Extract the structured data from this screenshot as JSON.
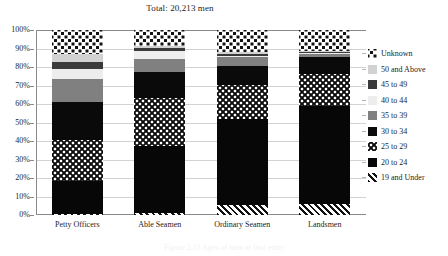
{
  "chart_data": {
    "type": "bar",
    "subtype": "stacked-percentage",
    "title": "Total: 20,213 men",
    "xlabel": "",
    "ylabel": "",
    "ylim": [
      0,
      100
    ],
    "ytick_labels": [
      "0%",
      "10%",
      "20%",
      "30%",
      "40%",
      "50%",
      "60%",
      "70%",
      "80%",
      "90%",
      "100%"
    ],
    "ytick_values": [
      0,
      10,
      20,
      30,
      40,
      50,
      60,
      70,
      80,
      90,
      100
    ],
    "grid": true,
    "legend_position": "right",
    "categories": [
      "Petty Officers",
      "Able Seamen",
      "Ordinary Seamen",
      "Landsmen"
    ],
    "series": [
      {
        "name": "19 and Under",
        "pattern": "diagonal-hatch",
        "color": "#ffffff",
        "values": [
          0.3,
          1.3,
          5.2,
          6.0
        ]
      },
      {
        "name": "20 to 24",
        "pattern": "solid",
        "color": "#070707",
        "values": [
          18.0,
          36.0,
          46.6,
          53.0
        ]
      },
      {
        "name": "25 to 29",
        "pattern": "dotted-checker",
        "color": "#0d0d0d",
        "values": [
          22.3,
          26.0,
          18.4,
          17.4
        ]
      },
      {
        "name": "30 to 34",
        "pattern": "solid",
        "color": "#0a0a0a",
        "values": [
          20.5,
          14.0,
          10.3,
          9.1
        ]
      },
      {
        "name": "35 to 39",
        "pattern": "solid",
        "color": "#808080",
        "values": [
          12.2,
          7.3,
          4.8,
          1.6
        ]
      },
      {
        "name": "40 to 44",
        "pattern": "solid",
        "color": "#ededed",
        "values": [
          5.7,
          4.1,
          0.8,
          0.4
        ]
      },
      {
        "name": "45 to 49",
        "pattern": "solid",
        "color": "#3a3a3a",
        "values": [
          3.6,
          1.4,
          0.9,
          0.5
        ]
      },
      {
        "name": "50 and Above",
        "pattern": "solid",
        "color": "#d2d2d2",
        "values": [
          4.3,
          1.0,
          1.3,
          0.5
        ]
      },
      {
        "name": "Unknown",
        "pattern": "diamond-dot",
        "color": "#ffffff",
        "values": [
          13.1,
          8.9,
          11.7,
          11.5
        ]
      }
    ]
  },
  "legend": {
    "items": [
      {
        "label": "Unknown",
        "swatch": "p-unknown"
      },
      {
        "label": "50 and Above",
        "swatch": "p-50plus"
      },
      {
        "label": "45 to 49",
        "swatch": "p-45"
      },
      {
        "label": "40 to 44",
        "swatch": "p-40"
      },
      {
        "label": "35 to 39",
        "swatch": "p-35"
      },
      {
        "label": "30 to 34",
        "swatch": "p-30"
      },
      {
        "label": "25 to 29",
        "swatch": "p-25"
      },
      {
        "label": "20 to 24",
        "swatch": "p-20"
      },
      {
        "label": "19 and Under",
        "swatch": "p-19"
      }
    ]
  },
  "caption": {
    "text": "Figure 2.11 Ages of men at first entry"
  }
}
